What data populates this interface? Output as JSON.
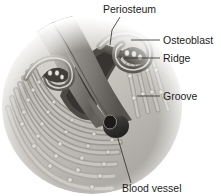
{
  "figure": {
    "style": "grayscale medical illustration",
    "background_color": "#ffffff",
    "ink_color": "#1c1c1c",
    "bone_light": "#d9d6d1",
    "bone_mid": "#a8a49e",
    "bone_dark": "#6e6a66",
    "vessel_dark": "#3a3836",
    "periosteum_tone": "#8b8882"
  },
  "labels": [
    {
      "id": "periosteum",
      "text": "Periosteum",
      "x": 103,
      "y": 13,
      "anchor": "start",
      "leader": "M 120 17 L 112 30 L 110 45"
    },
    {
      "id": "osteoblast",
      "text": "Osteoblast",
      "x": 163,
      "y": 44,
      "anchor": "start",
      "leader": "M 160 40 L 131 40"
    },
    {
      "id": "ridge",
      "text": "Ridge",
      "x": 163,
      "y": 62,
      "anchor": "start",
      "leader": "M 160 58 L 124 58"
    },
    {
      "id": "groove",
      "text": "Groove",
      "x": 163,
      "y": 100,
      "anchor": "start",
      "leader": "M 160 96 L 137 96"
    },
    {
      "id": "blood-vessel",
      "text": "Blood vessel",
      "x": 122,
      "y": 192,
      "anchor": "start",
      "leader": "M 131 183 L 116 132"
    }
  ],
  "structures": [
    {
      "id": "periosteum-sheet",
      "name": "periosteum",
      "description": "fibrous sheet folding over the bone ridge"
    },
    {
      "id": "osteoblast-row",
      "name": "osteoblasts",
      "description": "row of cells lining the ridge crest and groove"
    },
    {
      "id": "ridge-crest",
      "name": "ridge",
      "description": "raised bone ridge under the periosteal fold"
    },
    {
      "id": "groove-channel",
      "name": "groove",
      "description": "channel between ridges carrying the vessel"
    },
    {
      "id": "vessel-tube",
      "name": "blood vessel",
      "description": "dark tube running in the groove"
    },
    {
      "id": "lamellae",
      "name": "bone lamellae",
      "description": "concentric arcs of new bone with osteoblast beads"
    }
  ]
}
